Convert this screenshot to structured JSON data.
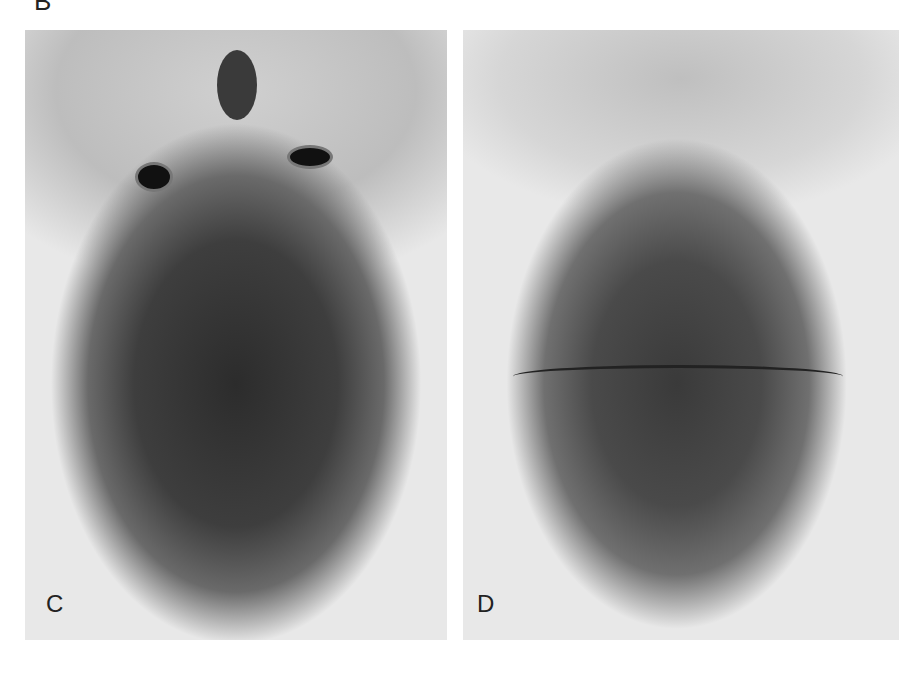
{
  "figure": {
    "top_label": "B",
    "panels": [
      {
        "id": "C",
        "label": "C",
        "description": "infant head viewed from above, face up"
      },
      {
        "id": "D",
        "label": "D",
        "description": "infant head viewed from above, back of head with scar line"
      }
    ]
  }
}
